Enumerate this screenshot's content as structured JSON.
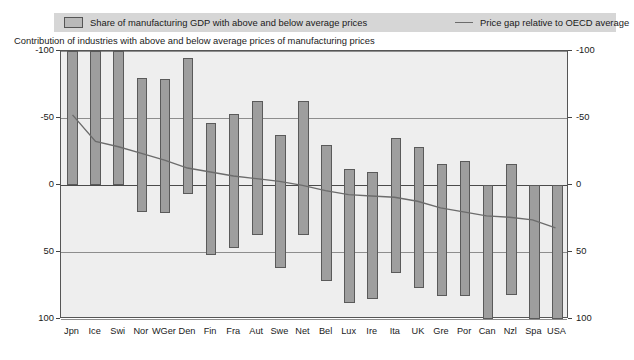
{
  "legend": {
    "series_bar_label": "Share of manufacturing GDP with above and below average prices",
    "series_line_label": "Price gap relative to OECD average",
    "bar_swatch_icon": "bar-swatch-icon",
    "line_swatch_icon": "line-swatch-icon"
  },
  "subtitle": "Contribution of industries with above and below average prices of manufacturing prices",
  "axis": {
    "left_ticks": [
      "100",
      "50",
      "0",
      "-50",
      "-100"
    ],
    "right_ticks": [
      "100",
      "50",
      "0",
      "-50",
      "-100"
    ]
  },
  "chart_data": {
    "type": "bar",
    "title": "",
    "subtitle": "Contribution of industries with above and below average prices of manufacturing prices",
    "xlabel": "",
    "ylabel": "",
    "ylim": [
      -100,
      100
    ],
    "yticks": [
      -100,
      -50,
      0,
      50,
      100
    ],
    "grid": true,
    "legend_position": "top",
    "categories": [
      "Jpn",
      "Ice",
      "Swi",
      "Nor",
      "WGer",
      "Den",
      "Fin",
      "Fra",
      "Aut",
      "Swe",
      "Net",
      "Bel",
      "Lux",
      "Ire",
      "Ita",
      "UK",
      "Gre",
      "Por",
      "Can",
      "Nzl",
      "Spa",
      "USA"
    ],
    "series": [
      {
        "name": "Share of manufacturing GDP with above and below average prices",
        "type": "bar-range",
        "note": "Each bar spans from a negative value (share with below average prices) to a positive value (share with above average prices)",
        "positive_values": [
          100,
          100,
          100,
          80,
          79,
          95,
          46,
          53,
          63,
          37,
          63,
          30,
          12,
          10,
          35,
          28,
          16,
          18,
          0,
          16,
          0,
          0
        ],
        "negative_values": [
          0,
          0,
          0,
          -20,
          -21,
          -7,
          -52,
          -47,
          -37,
          -62,
          -37,
          -72,
          -88,
          -85,
          -66,
          -77,
          -83,
          -83,
          -100,
          -82,
          -100,
          -100
        ]
      },
      {
        "name": "Price gap relative to OECD average",
        "type": "line",
        "values": [
          52,
          32,
          28,
          23,
          18,
          12,
          9,
          6,
          4,
          2,
          -1,
          -5,
          -8,
          -9,
          -10,
          -13,
          -18,
          -21,
          -24,
          -25,
          -27,
          -33
        ]
      }
    ]
  },
  "colors": {
    "bar_fill": "#9e9e9e",
    "bar_border": "#5a5a5a",
    "line": "#6c6c6c",
    "plot_background": "#eeeeee",
    "legend_background": "#d6d6d6",
    "gridline": "#8d8d8d",
    "text": "#1a1a1a"
  }
}
